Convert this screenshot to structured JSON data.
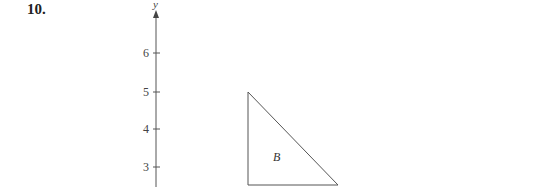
{
  "problem": {
    "number": "10."
  },
  "axis": {
    "label": "y",
    "ticks": [
      {
        "value": "6",
        "y": 53
      },
      {
        "value": "5",
        "y": 92
      },
      {
        "value": "4",
        "y": 129
      },
      {
        "value": "3",
        "y": 167
      }
    ]
  },
  "shape": {
    "label": "B",
    "type": "right-triangle",
    "vertices": [
      [
        248,
        92
      ],
      [
        248,
        185
      ],
      [
        338,
        185
      ]
    ]
  }
}
